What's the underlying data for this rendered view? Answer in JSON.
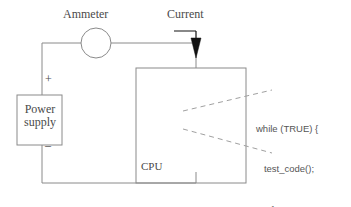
{
  "diagram": {
    "stroke_color": "#8a8a8a",
    "text_color": "#4a4a4a",
    "arrow_color": "#1a1a1a",
    "dash_color": "#9a9a9a"
  },
  "labels": {
    "ammeter": "Ammeter",
    "current": "Current",
    "power_supply": "Power\nsupply",
    "cpu": "CPU",
    "plus": "+",
    "minus": "–"
  },
  "code_callout": {
    "lines": [
      "while (TRUE) {",
      "   test_code();",
      "      }"
    ],
    "line1": "while (TRUE) {",
    "line2": "   test_code();",
    "line3": "      }"
  },
  "components": {
    "ammeter_circle": {
      "cx": 96,
      "cy": 43,
      "r": 15
    },
    "power_supply_box": {
      "x": 17,
      "y": 95,
      "w": 45,
      "h": 50
    },
    "cpu_box": {
      "x": 136,
      "y": 68,
      "w": 110,
      "h": 115
    },
    "current_arrow": {
      "x": 196,
      "y_top": 31,
      "y_tip": 57
    }
  }
}
